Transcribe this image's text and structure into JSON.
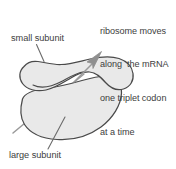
{
  "figure": {
    "title_alt": "Ribosome subunits translating mRNA",
    "labels": {
      "small_subunit": "small subunit",
      "large_subunit": "large subunit"
    },
    "annotation": {
      "line1": "ribosome moves",
      "line2": "along  the mRNA",
      "line3": "one triplet codon",
      "line4": "at a time"
    },
    "colors": {
      "shape_fill": "#e8e8e8",
      "shape_stroke": "#4a4a4a",
      "mrna_line": "#8c8c8c",
      "leader_line": "#6b6b6b",
      "text": "#3d3d3d",
      "background": "#ffffff"
    },
    "parts": [
      {
        "name": "small-subunit",
        "shape": "dumbbell"
      },
      {
        "name": "large-subunit",
        "shape": "rounded-blob"
      },
      {
        "name": "mrna-strand",
        "shape": "diagonal-line-with-arrow"
      }
    ]
  }
}
